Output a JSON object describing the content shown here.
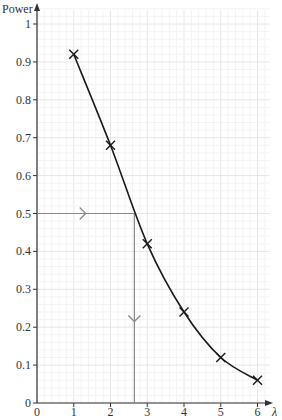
{
  "chart_data": {
    "type": "line",
    "title": "",
    "xlabel": "λ",
    "ylabel": "Power",
    "xlim": [
      0,
      6
    ],
    "ylim": [
      0,
      1
    ],
    "x_ticks": [
      0,
      1,
      2,
      3,
      4,
      5,
      6
    ],
    "y_ticks": [
      0,
      0.1,
      0.2,
      0.3,
      0.4,
      0.5,
      0.6,
      0.7,
      0.8,
      0.9,
      1
    ],
    "x_tick_labels": [
      "0",
      "1",
      "2",
      "3",
      "4",
      "5",
      "6"
    ],
    "y_tick_labels": [
      "0",
      "0.1",
      "0.2",
      "0.3",
      "0.4",
      "0.5",
      "0.6",
      "0.7",
      "0.8",
      "0.9",
      "1"
    ],
    "grid": true,
    "legend": null,
    "series": [
      {
        "name": "Power",
        "marker": "x",
        "smooth_curve": true,
        "x": [
          1,
          2,
          3,
          4,
          5,
          6
        ],
        "y": [
          0.92,
          0.68,
          0.42,
          0.24,
          0.12,
          0.06
        ]
      }
    ],
    "annotations": [
      {
        "type": "read-off-arrows",
        "description": "Horizontal arrow from Power = 0.5 to the curve, then vertical arrow down to the λ-axis",
        "power": 0.5,
        "lambda": 2.65
      }
    ],
    "colors": {
      "curve": "#1a1a1a",
      "axes": "#333333",
      "arrows": "#8a8a8a",
      "grid_major": "#e6e6e6",
      "grid_minor": "#f3f3f3"
    }
  }
}
